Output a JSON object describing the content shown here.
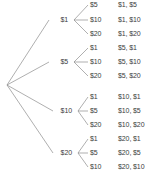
{
  "diagram": {
    "type": "probability-tree-diagram",
    "root": {
      "label": "",
      "x": 7,
      "y": 85
    },
    "colors": {
      "background": "#ffffff",
      "edge": "#8c8c8c",
      "text": "#3b3b3b"
    },
    "branches": [
      {
        "first_pick": "$1",
        "node": {
          "x": 74,
          "y": 20
        },
        "label_x": 52,
        "children": [
          {
            "second_pick": "$5",
            "outcome": "$1, $5",
            "y": 5
          },
          {
            "second_pick": "$10",
            "outcome": "$1, $10",
            "y": 20
          },
          {
            "second_pick": "$20",
            "outcome": "$1, $20",
            "y": 34
          }
        ]
      },
      {
        "first_pick": "$5",
        "node": {
          "x": 74,
          "y": 62
        },
        "label_x": 52,
        "children": [
          {
            "second_pick": "$1",
            "outcome": "$5, $1",
            "y": 48
          },
          {
            "second_pick": "$10",
            "outcome": "$5, $10",
            "y": 62
          },
          {
            "second_pick": "$20",
            "outcome": "$5, $20",
            "y": 76
          }
        ]
      },
      {
        "first_pick": "$10",
        "node": {
          "x": 78,
          "y": 111
        },
        "label_x": 56,
        "children": [
          {
            "second_pick": "$1",
            "outcome": "$10, $1",
            "y": 97
          },
          {
            "second_pick": "$5",
            "outcome": "$10, $5",
            "y": 111
          },
          {
            "second_pick": "$20",
            "outcome": "$10, $20",
            "y": 125
          }
        ]
      },
      {
        "first_pick": "$20",
        "node": {
          "x": 78,
          "y": 153
        },
        "label_x": 56,
        "children": [
          {
            "second_pick": "$1",
            "outcome": "$20, $1",
            "y": 139
          },
          {
            "second_pick": "$5",
            "outcome": "$20, $5",
            "y": 153
          },
          {
            "second_pick": "$10",
            "outcome": "$20, $10",
            "y": 167
          }
        ]
      }
    ],
    "columns": {
      "level2_label_x": 90,
      "outcome_label_x": 118
    }
  }
}
